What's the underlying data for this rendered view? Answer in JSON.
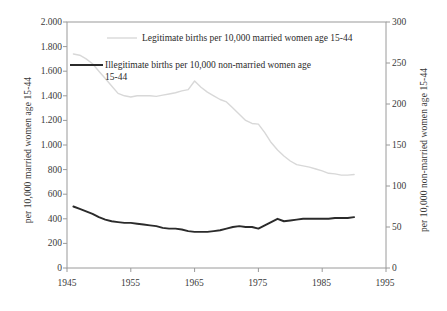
{
  "chart_data": {
    "type": "line",
    "title": "",
    "xlabel": "",
    "ylabel": "per 10,000 married women age 15-44",
    "y2label": "per 10,000 non-married women age 15-44",
    "xlim": [
      1945,
      1995
    ],
    "ylim": [
      0,
      2000
    ],
    "y2lim": [
      0,
      300
    ],
    "grid": false,
    "legend_position": "top-inside",
    "xticks": [
      "1945",
      "1955",
      "1965",
      "1975",
      "1985",
      "1995"
    ],
    "xtick_values": [
      1945,
      1955,
      1965,
      1975,
      1985,
      1995
    ],
    "yticks_left": [
      "0",
      "200",
      "400",
      "600",
      "800",
      "1.000",
      "1.200",
      "1.400",
      "1.600",
      "1.800",
      "2.000"
    ],
    "ytick_left_values": [
      0,
      200,
      400,
      600,
      800,
      1000,
      1200,
      1400,
      1600,
      1800,
      2000
    ],
    "yticks_right": [
      "0",
      "50",
      "100",
      "150",
      "200",
      "250",
      "300"
    ],
    "ytick_right_values": [
      0,
      50,
      100,
      150,
      200,
      250,
      300
    ],
    "series": [
      {
        "name": "Legitimate births per 10,000 married women age 15-44",
        "axis": "left",
        "color": "#d8d8d8",
        "x": [
          1946,
          1947,
          1948,
          1949,
          1950,
          1951,
          1952,
          1953,
          1954,
          1955,
          1956,
          1957,
          1958,
          1959,
          1960,
          1961,
          1962,
          1963,
          1964,
          1965,
          1966,
          1967,
          1968,
          1969,
          1970,
          1971,
          1972,
          1973,
          1974,
          1975,
          1976,
          1977,
          1978,
          1979,
          1980,
          1981,
          1982,
          1983,
          1984,
          1985,
          1986,
          1987,
          1988,
          1989,
          1990
        ],
        "values": [
          1740,
          1730,
          1700,
          1660,
          1600,
          1540,
          1480,
          1420,
          1400,
          1390,
          1400,
          1400,
          1400,
          1395,
          1405,
          1415,
          1425,
          1440,
          1450,
          1520,
          1470,
          1430,
          1400,
          1370,
          1350,
          1300,
          1250,
          1200,
          1175,
          1170,
          1100,
          1020,
          960,
          910,
          870,
          840,
          830,
          820,
          805,
          790,
          770,
          765,
          755,
          755,
          760
        ],
        "value_at_peak": 1520,
        "peak_year": 1965
      },
      {
        "name": "Illegitimate births per 10,000 non-married women age 15-44",
        "axis": "right",
        "color": "#2b2b2b",
        "x": [
          1946,
          1947,
          1948,
          1949,
          1950,
          1951,
          1952,
          1953,
          1954,
          1955,
          1956,
          1957,
          1958,
          1959,
          1960,
          1961,
          1962,
          1963,
          1964,
          1965,
          1966,
          1967,
          1968,
          1969,
          1970,
          1971,
          1972,
          1973,
          1974,
          1975,
          1976,
          1977,
          1978,
          1979,
          1980,
          1981,
          1982,
          1983,
          1984,
          1985,
          1986,
          1987,
          1988,
          1989,
          1990
        ],
        "values": [
          75,
          72,
          69,
          66,
          62,
          59,
          57,
          56,
          55,
          55,
          54,
          53,
          52,
          51,
          49,
          48,
          48,
          47,
          45,
          44,
          44,
          44,
          45,
          46,
          48,
          50,
          51,
          50,
          50,
          48,
          52,
          56,
          60,
          57,
          58,
          59,
          60,
          60,
          60,
          60,
          60,
          61,
          61,
          61,
          62
        ]
      }
    ],
    "annotations": []
  },
  "legend": {
    "legitimate_label": "Legitimate births per 10,000 married women age 15-44",
    "illegitimate_label_line1": "Illegitimate births per 10,000 non-married women age",
    "illegitimate_label_line2": "15-44",
    "legitimate_swatch_color": "#d8d8d8",
    "illegitimate_swatch_color": "#2b2b2b"
  },
  "axes": {
    "left_title": "per 10,000 married women age 15-44",
    "right_title": "per 10,000 non-married women age 15-44",
    "left_ticks": [
      {
        "label": "2.000"
      },
      {
        "label": "1.800"
      },
      {
        "label": "1.600"
      },
      {
        "label": "1.400"
      },
      {
        "label": "1.200"
      },
      {
        "label": "1.000"
      },
      {
        "label": "800"
      },
      {
        "label": "600"
      },
      {
        "label": "400"
      },
      {
        "label": "200"
      },
      {
        "label": "0"
      }
    ],
    "right_ticks": [
      {
        "label": "300"
      },
      {
        "label": "250"
      },
      {
        "label": "200"
      },
      {
        "label": "150"
      },
      {
        "label": "100"
      },
      {
        "label": "50"
      },
      {
        "label": "0"
      }
    ],
    "x_ticks": [
      {
        "label": "1945"
      },
      {
        "label": "1955"
      },
      {
        "label": "1965"
      },
      {
        "label": "1975"
      },
      {
        "label": "1985"
      },
      {
        "label": "1995"
      }
    ]
  }
}
